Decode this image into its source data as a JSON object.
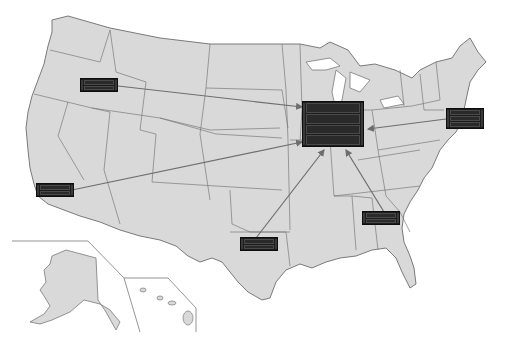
{
  "diagram": {
    "type": "network-map",
    "region": "United States",
    "colors": {
      "land": "#d9d9d9",
      "border": "#7a7a7a",
      "arrow": "#6e6e6e",
      "rack": "#1c1c1c",
      "background": "#ffffff"
    },
    "hub": {
      "id": "hub-midwest",
      "location": "Illinois / Chicago area",
      "units": [
        "",
        "",
        "",
        ""
      ]
    },
    "sites": [
      {
        "id": "site-oregon",
        "location": "Oregon/Idaho",
        "units": [
          "",
          ""
        ]
      },
      {
        "id": "site-northeast",
        "location": "New York/New Jersey",
        "units": [
          "",
          "",
          ""
        ]
      },
      {
        "id": "site-california",
        "location": "Southern California",
        "units": [
          "",
          ""
        ]
      },
      {
        "id": "site-texas",
        "location": "Texas",
        "units": [
          "",
          ""
        ]
      },
      {
        "id": "site-georgia",
        "location": "Georgia",
        "units": [
          "",
          ""
        ]
      }
    ],
    "insets": [
      "Alaska",
      "Hawaii"
    ],
    "connections": [
      {
        "from": "site-oregon",
        "to": "hub-midwest"
      },
      {
        "from": "site-northeast",
        "to": "hub-midwest"
      },
      {
        "from": "site-california",
        "to": "hub-midwest"
      },
      {
        "from": "site-texas",
        "to": "hub-midwest"
      },
      {
        "from": "site-georgia",
        "to": "hub-midwest"
      }
    ]
  }
}
